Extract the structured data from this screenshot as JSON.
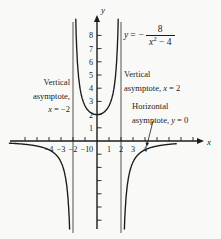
{
  "figure": {
    "ink_color": "#1b1b1b",
    "asymptote_line_color": "#3c3c3c",
    "background_color": "#f9f9f7",
    "equation": {
      "lhs_var": "y",
      "eq": "=",
      "minus": "−",
      "numerator": "8",
      "den_var": "x",
      "den_exp": "2",
      "den_rest": " − 4"
    },
    "labels": {
      "left": {
        "l1": "Vertical",
        "l2": "asymptote,",
        "var": "x",
        "rel": " = −2"
      },
      "right": {
        "l1": "Vertical",
        "l2a": "asymptote, ",
        "var": "x",
        "rel": " = 2"
      },
      "horizontal": {
        "l1": "Horizontal",
        "l2a": "asymptote, ",
        "var": "y",
        "rel": " = 0"
      }
    }
  },
  "chart_data": {
    "type": "line",
    "function": {
      "form": "rational",
      "numerator": -8,
      "den_x2_const": -4,
      "expression": "y = -8/(x^2 - 4)"
    },
    "vertical_asymptotes": [
      -2,
      2
    ],
    "horizontal_asymptote": 0,
    "minimum_point": {
      "x": 0,
      "y": 2
    },
    "branches": [
      {
        "name": "left",
        "x_range": [
          -7.3,
          -2.26
        ]
      },
      {
        "name": "middle",
        "x_range": [
          -1.79,
          1.79
        ]
      },
      {
        "name": "right",
        "x_range": [
          2.26,
          6.6
        ]
      }
    ],
    "x_ticks": [
      -6,
      -5,
      -4,
      -3,
      -2,
      -1,
      1,
      2,
      3,
      4,
      5,
      6,
      7,
      8
    ],
    "labeled_x_ticks": [
      -4,
      -3,
      -2,
      -1,
      0,
      1,
      2,
      3,
      4
    ],
    "y_ticks": [
      -6,
      -5,
      -4,
      -3,
      -2,
      -1,
      1,
      2,
      3,
      4,
      5,
      6,
      7,
      8
    ],
    "labeled_y_ticks": [
      1,
      2,
      3,
      4,
      5,
      6,
      7,
      8
    ],
    "xlabel": "x",
    "ylabel": "y",
    "xlim": [
      -7.3,
      8.9
    ],
    "ylim": [
      -7.2,
      9.3
    ],
    "grid": false,
    "legend": false
  }
}
